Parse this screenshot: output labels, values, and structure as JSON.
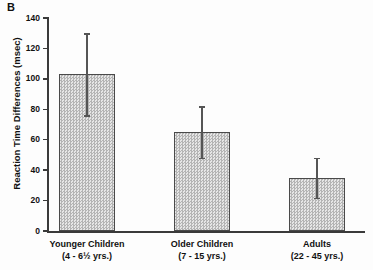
{
  "panel": {
    "label": "B"
  },
  "chart_data": {
    "type": "bar",
    "title": "",
    "xlabel": "",
    "ylabel": "Reaction Time Differences (msec)",
    "ylim": [
      0,
      140
    ],
    "yticks": [
      0,
      20,
      40,
      60,
      80,
      100,
      120,
      140
    ],
    "grid": false,
    "legend": null,
    "categories": [
      "Younger Children (4 - 6½ yrs.)",
      "Older Children (7 - 15 yrs.)",
      "Adults (22 - 45 yrs.)"
    ],
    "category_lines": [
      {
        "line1": "Younger Children",
        "line2": "(4 - 6½ yrs.)"
      },
      {
        "line1": "Older Children",
        "line2": "(7 - 15 yrs.)"
      },
      {
        "line1": "Adults",
        "line2": "(22 - 45 yrs.)"
      }
    ],
    "values": [
      103,
      65,
      35
    ],
    "error_low": [
      76,
      48,
      22
    ],
    "error_high": [
      130,
      82,
      48
    ],
    "error_minus": [
      27,
      17,
      13
    ],
    "error_plus": [
      27,
      17,
      13
    ],
    "bar_fill": "#c9c9c9",
    "bar_edge": "#4a4a4a",
    "axis_color": "#3a3a3a"
  }
}
